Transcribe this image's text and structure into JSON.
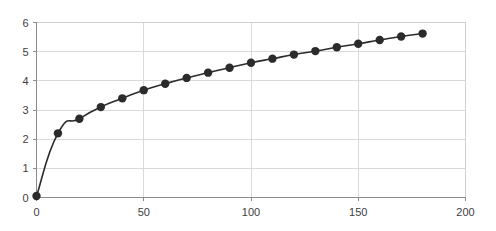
{
  "chart_data": {
    "type": "line",
    "title": "",
    "subtitle": "",
    "xlabel": "",
    "ylabel": "",
    "xlim": [
      0,
      200
    ],
    "ylim": [
      0,
      6
    ],
    "xticks": [
      0,
      50,
      100,
      150,
      200
    ],
    "yticks": [
      0,
      1,
      2,
      3,
      4,
      5,
      6
    ],
    "xtick_labels": [
      "0",
      "50",
      "100",
      "150",
      "200"
    ],
    "ytick_labels": [
      "0",
      "1",
      "2",
      "3",
      "4",
      "5",
      "6"
    ],
    "grid": {
      "horizontal": true,
      "vertical": true,
      "color": "#d9d9d9"
    },
    "legend": {
      "visible": false,
      "position": "none",
      "entries": []
    },
    "annotations": [],
    "marker": {
      "shape": "circle",
      "size": 4.2,
      "color": "#2b2b2b"
    },
    "series": [
      {
        "name": "series-1",
        "color": "#2b2b2b",
        "line_width": 1.6,
        "x": [
          0,
          10,
          20,
          30,
          40,
          50,
          60,
          70,
          80,
          90,
          100,
          110,
          120,
          130,
          140,
          150,
          160,
          170,
          180
        ],
        "values": [
          0.05,
          2.2,
          2.7,
          3.1,
          3.4,
          3.68,
          3.9,
          4.1,
          4.28,
          4.45,
          4.62,
          4.76,
          4.9,
          5.02,
          5.15,
          5.27,
          5.4,
          5.52,
          5.62
        ]
      }
    ]
  },
  "colors": {
    "background": "#ffffff",
    "grid": "#d9d9d9",
    "border": "#d0d0d0",
    "axis": "#8c8c8c",
    "series": "#2b2b2b",
    "tick_text": "#3d3d3d"
  }
}
